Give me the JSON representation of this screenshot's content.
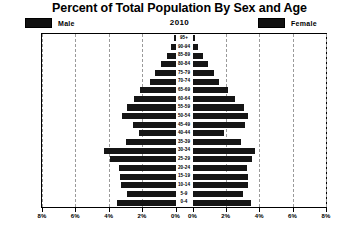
{
  "chart": {
    "title": "Percent of Total Population By Sex and Age",
    "year": "2010",
    "legend": {
      "male": "Male",
      "female": "Female"
    },
    "colors": {
      "bar": "#151515",
      "grid": "#9a9a9a",
      "frame": "#000000",
      "background": "#ffffff"
    }
  },
  "axis": {
    "ticks_left": [
      "8%",
      "6%",
      "4%",
      "2%",
      "0%"
    ],
    "ticks_right": [
      "0%",
      "2%",
      "4%",
      "6%",
      "8%"
    ],
    "max_percent": 8,
    "tick_step": 2
  },
  "chart_data": {
    "type": "bar",
    "title": "Percent of Total Population By Sex and Age",
    "subtitle": "2010",
    "xlabel": "",
    "ylabel": "",
    "xlim": [
      -8,
      8
    ],
    "grid": true,
    "legend_position": "top",
    "orientation": "horizontal-diverging",
    "categories": [
      "95+",
      "90-94",
      "85-89",
      "80-84",
      "75-79",
      "70-74",
      "65-69",
      "60-64",
      "55-59",
      "50-54",
      "45-49",
      "40-44",
      "35-39",
      "30-34",
      "25-29",
      "20-24",
      "15-19",
      "10-14",
      "5-9",
      "0-4"
    ],
    "series": [
      {
        "name": "Male",
        "values": [
          0.1,
          0.25,
          0.5,
          0.85,
          1.25,
          1.55,
          2.1,
          2.5,
          2.9,
          3.2,
          2.55,
          2.2,
          2.95,
          4.3,
          3.9,
          3.4,
          3.3,
          3.25,
          2.9,
          3.5
        ]
      },
      {
        "name": "Female",
        "values": [
          0.15,
          0.35,
          0.6,
          0.95,
          1.3,
          1.6,
          2.1,
          2.55,
          3.1,
          3.3,
          3.15,
          1.9,
          2.9,
          3.75,
          3.55,
          3.25,
          3.3,
          3.35,
          3.0,
          3.5
        ]
      }
    ]
  }
}
